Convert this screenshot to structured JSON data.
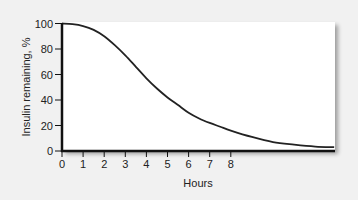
{
  "chart_data": {
    "type": "line",
    "title": "",
    "xlabel": "Hours",
    "ylabel": "Insulin remaining, %",
    "xlim": [
      0,
      12.9
    ],
    "ylim": [
      0,
      100
    ],
    "x_ticks": [
      0,
      1,
      2,
      3,
      4,
      5,
      6,
      7,
      8
    ],
    "y_ticks": [
      0,
      20,
      40,
      60,
      80,
      100
    ],
    "grid": false,
    "legend": null,
    "series": [
      {
        "name": "Insulin remaining",
        "color": "#222222",
        "x": [
          0,
          0.5,
          1,
          1.5,
          2,
          2.5,
          3,
          3.5,
          4,
          4.5,
          5,
          5.5,
          6,
          6.5,
          7,
          7.5,
          8,
          9,
          10,
          11,
          12,
          12.9
        ],
        "values": [
          100,
          99.5,
          98,
          95,
          90,
          83,
          75,
          66,
          57,
          49,
          42,
          36,
          30,
          25.5,
          22,
          19,
          16,
          11,
          7,
          5,
          3.5,
          3
        ]
      }
    ]
  },
  "colors": {
    "background": "#f1f1f1",
    "panel": "#ffffff",
    "line": "#222222",
    "axis": "#111111"
  }
}
